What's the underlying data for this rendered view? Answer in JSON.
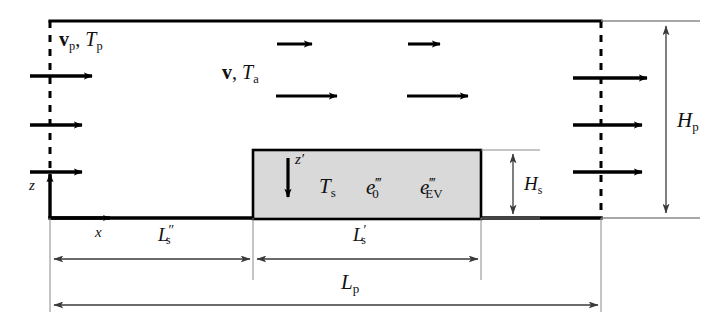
{
  "figure": {
    "kind": "schematic-diagram",
    "background_color": "#ffffff",
    "line_color": "#000000",
    "block_fill_color": "#d9d9d9",
    "dimension_line_color": "#6f6f6f"
  },
  "labels": {
    "inlet_velocity": {
      "vector": "v",
      "sub1": "p",
      "comma": ", ",
      "temp": "T",
      "sub2": "p",
      "full": "v_p , T_p"
    },
    "free_stream": {
      "vector": "v",
      "comma": ", ",
      "temp": "T",
      "sub": "a",
      "full": "v , T_a"
    },
    "block_temperature": {
      "symbol": "T",
      "sub": "s",
      "full": "T_s"
    },
    "source_term_0": {
      "symbol": "e",
      "sub": "0",
      "sup": "‴",
      "full": "e_0'''"
    },
    "source_term_ev": {
      "symbol": "e",
      "sub": "EV",
      "sup": "‴",
      "full": "e_EV'''"
    },
    "axis_z": {
      "symbol": "z",
      "full": "z"
    },
    "axis_x": {
      "symbol": "x",
      "full": "x"
    },
    "axis_z_prime": {
      "symbol": "z",
      "sup": "′",
      "full": "z'"
    },
    "height_channel": {
      "symbol": "H",
      "sub": "p",
      "full": "H_p"
    },
    "height_block": {
      "symbol": "H",
      "sub": "s",
      "full": "H_s"
    },
    "length_upstream": {
      "symbol": "L",
      "sub": "s",
      "sup": "″",
      "full": "L_s''"
    },
    "length_block": {
      "symbol": "L",
      "sub": "s",
      "sup": "′",
      "full": "L_s'"
    },
    "length_channel": {
      "symbol": "L",
      "sub": "p",
      "full": "L_p"
    }
  },
  "arrows": {
    "inlet_profile_count": 3,
    "outlet_profile_count": 3,
    "interior_count": 4,
    "block_z_prime_count": 1,
    "axis_count": 2,
    "direction": "rightward"
  },
  "dimensions": {
    "channel_height_label": "H_p",
    "block_height_label": "H_s",
    "upstream_length_label": "L_s''",
    "block_length_label": "L_s'",
    "channel_length_label": "L_p"
  }
}
